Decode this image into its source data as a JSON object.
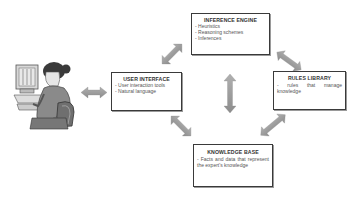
{
  "diagram": {
    "type": "expert-system-architecture",
    "nodes": {
      "inference_engine": {
        "title": "INFERENCE ENGINE",
        "items": [
          "- Heuristics",
          "- Reasoning schemes",
          "- Inferences"
        ]
      },
      "user_interface": {
        "title": "USER INTERFACE",
        "items": [
          "- User interaction tools",
          "- Natural language"
        ]
      },
      "rules_library": {
        "title": "RULES LIBRARY",
        "description": "- rules that manage knowledge"
      },
      "knowledge_base": {
        "title": "KNOWLEDGE BASE",
        "description": "- Facts and data that represent the expert's knowledge"
      },
      "user": {
        "label": "user-at-computer-illustration"
      }
    },
    "edges": [
      {
        "from": "user",
        "to": "user_interface",
        "direction": "bidirectional"
      },
      {
        "from": "user_interface",
        "to": "inference_engine",
        "direction": "bidirectional"
      },
      {
        "from": "inference_engine",
        "to": "rules_library",
        "direction": "bidirectional"
      },
      {
        "from": "user_interface",
        "to": "knowledge_base",
        "direction": "bidirectional"
      },
      {
        "from": "rules_library",
        "to": "knowledge_base",
        "direction": "bidirectional"
      },
      {
        "from": "inference_engine",
        "to": "knowledge_base",
        "direction": "bidirectional"
      }
    ],
    "colors": {
      "arrow_fill": "#9a9a9a",
      "box_border": "#3a3a3a",
      "text": "#444444"
    }
  }
}
